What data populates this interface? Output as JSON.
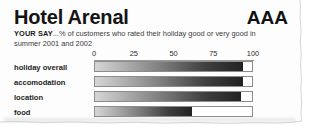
{
  "clipping": {
    "title": "Hotel Arenal",
    "rating": "AAA",
    "subtitle_lead": "YOUR SAY",
    "subtitle_text": "...% of customers who rated their holiday good or very good in summer 2001 and 2002",
    "colors": {
      "paper": "#fdfdfd",
      "text": "#141414",
      "bar_frame": "#8c8c8c",
      "bar_dark": "#222222",
      "bar_light": "#d6d6d6"
    }
  },
  "chart_data": {
    "type": "bar",
    "orientation": "horizontal",
    "title": "Hotel Arenal",
    "subtitle": "YOUR SAY ...% of customers who rated their holiday good or very good in summer 2001 and 2002",
    "xlabel": "",
    "ylabel": "",
    "xlim": [
      0,
      100
    ],
    "grid": false,
    "legend": "none",
    "ticks": [
      0,
      25,
      50,
      75,
      100
    ],
    "tick_labels": [
      "0",
      "25",
      "50",
      "75",
      "100"
    ],
    "categories": [
      "holiday overall",
      "accomodation",
      "location",
      "food"
    ],
    "values": [
      94,
      94,
      93,
      62
    ],
    "series": [
      {
        "name": "% rated good or very good",
        "values": [
          94,
          94,
          93,
          62
        ]
      }
    ]
  }
}
